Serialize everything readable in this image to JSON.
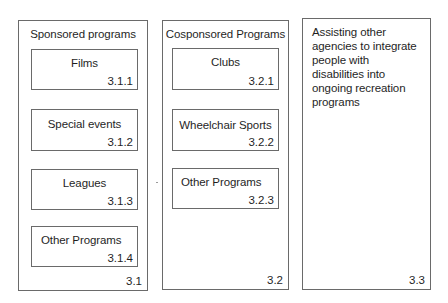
{
  "diagram": {
    "columns": [
      {
        "id": "3.1",
        "title": "Sponsored programs",
        "number": "3.1",
        "items": [
          {
            "label": "Films",
            "number": "3.1.1"
          },
          {
            "label": "Special events",
            "number": "3.1.2"
          },
          {
            "label": "Leagues",
            "number": "3.1.3"
          },
          {
            "label": "Other Programs",
            "number": "3.1.4"
          }
        ]
      },
      {
        "id": "3.2",
        "title": "Cosponsored Programs",
        "number": "3.2",
        "items": [
          {
            "label": "Clubs",
            "number": "3.2.1"
          },
          {
            "label": "Wheelchair Sports",
            "number": "3.2.2"
          },
          {
            "label": "Other Programs",
            "number": "3.2.3"
          }
        ]
      },
      {
        "id": "3.3",
        "title": "Assisting other agencies to integrate people with disabilities into ongoing recreation programs",
        "number": "3.3",
        "items": []
      }
    ]
  }
}
